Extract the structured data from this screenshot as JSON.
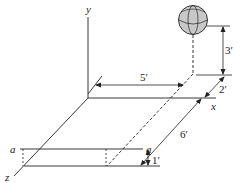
{
  "diagram": {
    "axes": {
      "x_label": "x",
      "y_label": "y",
      "z_label": "z"
    },
    "plane_labels": {
      "left": "a",
      "right": "a"
    },
    "dimensions": {
      "height_above_plane": "3′",
      "depth_offset": "2′",
      "x_distance": "5′",
      "z_distance": "6′",
      "plane_offset": "1′"
    },
    "object": {
      "type": "sphere",
      "fill_color": "#c8c8c8"
    },
    "line_color": "#222222"
  }
}
